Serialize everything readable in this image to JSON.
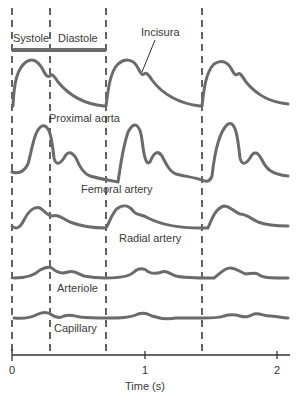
{
  "phases": {
    "systole_label": "Systole",
    "diastole_label": "Diastole"
  },
  "annotation": {
    "incisura_label": "Incisura"
  },
  "waveforms": [
    {
      "name": "proximal-aorta",
      "label": "Proximal aorta"
    },
    {
      "name": "femoral-artery",
      "label": "Femoral artery"
    },
    {
      "name": "radial-artery",
      "label": "Radial artery"
    },
    {
      "name": "arteriole",
      "label": "Arteriole"
    },
    {
      "name": "capillary",
      "label": "Capillary"
    }
  ],
  "axis": {
    "xlabel": "Time (s)",
    "ticks": [
      "0",
      "1",
      "2"
    ]
  },
  "colors": {
    "waveform": "#6b6b6b",
    "phase_bar": "#6b6b6b",
    "axis": "#333333",
    "dashed_line": "#222222"
  }
}
